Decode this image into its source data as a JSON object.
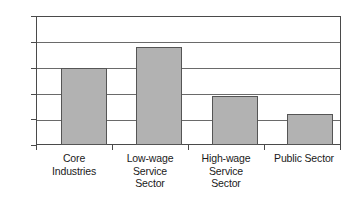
{
  "chart_data": {
    "type": "bar",
    "title": "",
    "xlabel": "",
    "ylabel": "",
    "categories": [
      "Core Industries",
      "Low-wage Service Sector",
      "High-wage Service Sector",
      "Public Sector"
    ],
    "category_lines": [
      [
        "Core",
        "Industries"
      ],
      [
        "Low-wage",
        "Service",
        "Sector"
      ],
      [
        "High-wage",
        "Service",
        "Sector"
      ],
      [
        "Public Sector"
      ]
    ],
    "values": [
      30,
      38,
      19,
      12
    ],
    "ylim": [
      0,
      50
    ],
    "ytick_labels": [
      "0",
      "10",
      "20",
      "30",
      "40",
      "50"
    ],
    "ytick_values": [
      0,
      10,
      20,
      30,
      40,
      50
    ],
    "grid": true,
    "grid_axis": "y",
    "legend": false,
    "bar_fill_color": "#b2b2b2",
    "bar_edge_color": "#555555",
    "axis_color": "#4a4a4a",
    "gridline_color": "#6a6a6a",
    "background_color": "#ffffff"
  }
}
